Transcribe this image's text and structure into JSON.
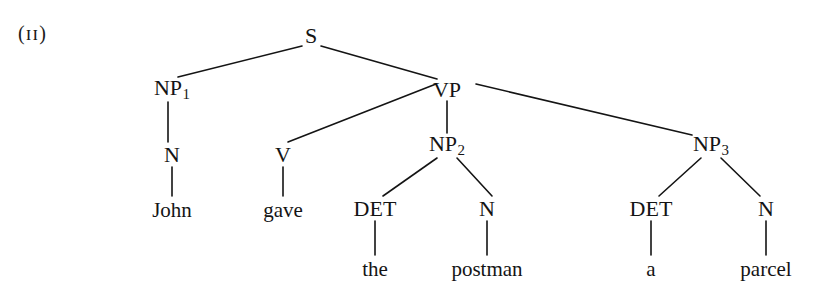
{
  "figure": {
    "example_number": "(ɪɪ)",
    "background_color": "#ffffff",
    "ink_color": "#141414",
    "sentence": "John gave the postman a parcel"
  },
  "tree": {
    "nodes": [
      {
        "id": "S",
        "label": "S",
        "subscript": "",
        "x": 311,
        "y": 36
      },
      {
        "id": "NP1",
        "label": "NP",
        "subscript": "1",
        "x": 172,
        "y": 90
      },
      {
        "id": "VP",
        "label": "VP",
        "subscript": "",
        "x": 447,
        "y": 90
      },
      {
        "id": "N1",
        "label": "N",
        "subscript": "",
        "x": 172,
        "y": 155
      },
      {
        "id": "V",
        "label": "V",
        "subscript": "",
        "x": 283,
        "y": 155
      },
      {
        "id": "NP2",
        "label": "NP",
        "subscript": "2",
        "x": 447,
        "y": 146
      },
      {
        "id": "NP3",
        "label": "NP",
        "subscript": "3",
        "x": 711,
        "y": 146
      },
      {
        "id": "DET1",
        "label": "DET",
        "subscript": "",
        "x": 375,
        "y": 209
      },
      {
        "id": "N2",
        "label": "N",
        "subscript": "",
        "x": 487,
        "y": 209
      },
      {
        "id": "DET2",
        "label": "DET",
        "subscript": "",
        "x": 651,
        "y": 209
      },
      {
        "id": "N3",
        "label": "N",
        "subscript": "",
        "x": 766,
        "y": 209
      }
    ],
    "leaves": [
      {
        "id": "w-john",
        "label": "John",
        "x": 172,
        "y": 210
      },
      {
        "id": "w-gave",
        "label": "gave",
        "x": 283,
        "y": 210
      },
      {
        "id": "w-the",
        "label": "the",
        "x": 375,
        "y": 269
      },
      {
        "id": "w-postman",
        "label": "postman",
        "x": 487,
        "y": 269
      },
      {
        "id": "w-a",
        "label": "a",
        "x": 651,
        "y": 269
      },
      {
        "id": "w-parcel",
        "label": "parcel",
        "x": 766,
        "y": 269
      }
    ],
    "edges": [
      {
        "from": "S",
        "to": "NP1",
        "x1": 302,
        "y1": 46,
        "x2": 178,
        "y2": 77
      },
      {
        "from": "S",
        "to": "VP",
        "x1": 321,
        "y1": 46,
        "x2": 437,
        "y2": 79
      },
      {
        "from": "VP",
        "to": "V",
        "x1": 436,
        "y1": 84,
        "x2": 288,
        "y2": 142
      },
      {
        "from": "VP",
        "to": "NP2",
        "x1": 447,
        "y1": 101,
        "x2": 447,
        "y2": 133
      },
      {
        "from": "VP",
        "to": "NP3",
        "x1": 476,
        "y1": 84,
        "x2": 692,
        "y2": 135
      },
      {
        "from": "NP1",
        "to": "N1",
        "x1": 168,
        "y1": 102,
        "x2": 168,
        "y2": 142
      },
      {
        "from": "N1",
        "to": "w-john",
        "x1": 172,
        "y1": 167,
        "x2": 172,
        "y2": 196
      },
      {
        "from": "V",
        "to": "w-gave",
        "x1": 283,
        "y1": 167,
        "x2": 283,
        "y2": 196
      },
      {
        "from": "NP2",
        "to": "DET1",
        "x1": 437,
        "y1": 158,
        "x2": 383,
        "y2": 196
      },
      {
        "from": "NP2",
        "to": "N2",
        "x1": 457,
        "y1": 158,
        "x2": 492,
        "y2": 196
      },
      {
        "from": "NP3",
        "to": "DET2",
        "x1": 701,
        "y1": 158,
        "x2": 659,
        "y2": 196
      },
      {
        "from": "NP3",
        "to": "N3",
        "x1": 721,
        "y1": 158,
        "x2": 760,
        "y2": 196
      },
      {
        "from": "DET1",
        "to": "w-the",
        "x1": 375,
        "y1": 221,
        "x2": 375,
        "y2": 255
      },
      {
        "from": "N2",
        "to": "w-postman",
        "x1": 487,
        "y1": 221,
        "x2": 487,
        "y2": 255
      },
      {
        "from": "DET2",
        "to": "w-a",
        "x1": 651,
        "y1": 221,
        "x2": 651,
        "y2": 255
      },
      {
        "from": "N3",
        "to": "w-parcel",
        "x1": 766,
        "y1": 221,
        "x2": 766,
        "y2": 255
      }
    ]
  }
}
